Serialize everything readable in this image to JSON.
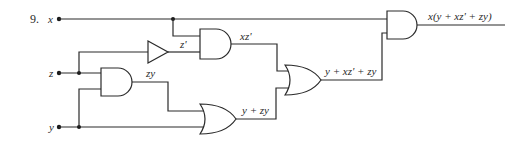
{
  "problem_number": "9.",
  "inputs": {
    "x": "x",
    "z": "z",
    "y": "y"
  },
  "gates": [
    {
      "id": "not1",
      "type": "NOT",
      "inputs": [
        "z"
      ],
      "output_label": "z'"
    },
    {
      "id": "and1",
      "type": "AND",
      "inputs": [
        "x",
        "z'"
      ],
      "output_label": "xz'"
    },
    {
      "id": "and3",
      "type": "AND",
      "inputs": [
        "z",
        "y"
      ],
      "output_label": "zy"
    },
    {
      "id": "or1",
      "type": "OR",
      "inputs": [
        "zy",
        "y"
      ],
      "output_label": "y + zy"
    },
    {
      "id": "or2",
      "type": "OR",
      "inputs": [
        "xz'",
        "y + zy"
      ],
      "output_label": "y + xz' + zy"
    },
    {
      "id": "and2",
      "type": "AND",
      "inputs": [
        "x",
        "y + xz' + zy"
      ],
      "output_label": "x(y + xz' + zy)"
    }
  ],
  "labels": {
    "not_out": "z'",
    "and1_out": "xz'",
    "and3_out": "zy",
    "or1_out": "y + zy",
    "or2_out": "y + xz' + zy",
    "final_out": "x(y + xz' + zy)"
  }
}
